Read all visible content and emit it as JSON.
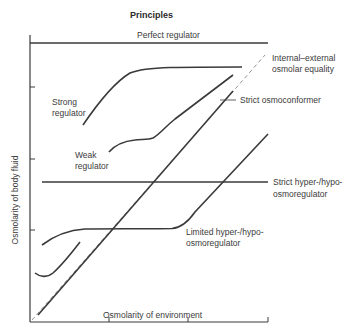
{
  "title": "Principles",
  "axes": {
    "xlabel": "Osmolarity of environment",
    "ylabel": "Osmolarity of body fluid"
  },
  "labels": {
    "perfect_regulator": "Perfect regulator",
    "equality_line1": "Internal–external",
    "equality_line2": "osmolar equality",
    "strong_line1": "Strong",
    "strong_line2": "regulator",
    "strict_osmoconformer": "Strict osmoconformer",
    "weak_line1": "Weak",
    "weak_line2": "regulator",
    "strict_hyper_line1": "Strict hyper-/hypo-",
    "strict_hyper_line2": "osmoregulator",
    "limited_line1": "Limited hyper-/hypo-",
    "limited_line2": "osmoregulator"
  },
  "colors": {
    "line": "#3a3a3a",
    "dashed": "#888888"
  }
}
